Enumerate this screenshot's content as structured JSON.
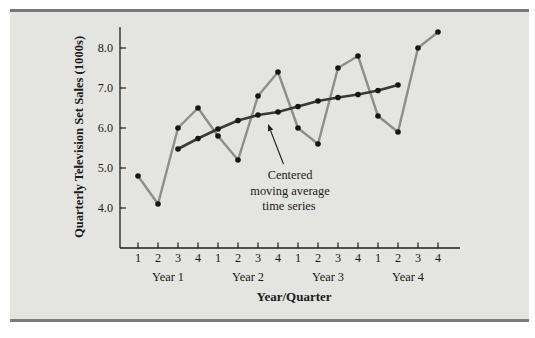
{
  "figure": {
    "page_bg": "#ffffff",
    "panel_bg": "#e4e5e1",
    "rule_color": "#77787a",
    "text_color": "#1a1a1a",
    "axis_color": "#1c1c1c"
  },
  "chart_data": {
    "type": "line",
    "title": "",
    "xlabel": "Year/Quarter",
    "ylabel": "Quarterly Television Set Sales (1000s)",
    "ylim": [
      3.0,
      8.6
    ],
    "yticks": [
      4.0,
      5.0,
      6.0,
      7.0,
      8.0
    ],
    "ytick_labels": [
      "4.0",
      "5.0",
      "6.0",
      "7.0",
      "8.0"
    ],
    "quarter_tick_labels": [
      "1",
      "2",
      "3",
      "4",
      "1",
      "2",
      "3",
      "4",
      "1",
      "2",
      "3",
      "4",
      "1",
      "2",
      "3",
      "4"
    ],
    "year_labels": [
      "Year 1",
      "Year 2",
      "Year 3",
      "Year 4"
    ],
    "grid": false,
    "legend_position": "none",
    "series": [
      {
        "name": "Quarterly television set sales",
        "line_color": "#8d8e8c",
        "marker_color": "#161616",
        "x": [
          1,
          2,
          3,
          4,
          5,
          6,
          7,
          8,
          9,
          10,
          11,
          12,
          13,
          14,
          15,
          16
        ],
        "values": [
          4.8,
          4.1,
          6.0,
          6.5,
          5.8,
          5.2,
          6.8,
          7.4,
          6.0,
          5.6,
          7.5,
          7.8,
          6.3,
          5.9,
          8.0,
          8.4
        ]
      },
      {
        "name": "Centered moving average time series",
        "line_color": "#3a3a38",
        "marker_color": "#161616",
        "x": [
          3,
          4,
          5,
          6,
          7,
          8,
          9,
          10,
          11,
          12,
          13,
          14
        ],
        "values": [
          5.475,
          5.738,
          5.975,
          6.188,
          6.325,
          6.4,
          6.538,
          6.675,
          6.763,
          6.838,
          6.938,
          7.075
        ]
      }
    ],
    "annotation": {
      "line1": "Centered",
      "line2": "moving average",
      "line3": "time series",
      "target": "centered moving average line"
    }
  }
}
